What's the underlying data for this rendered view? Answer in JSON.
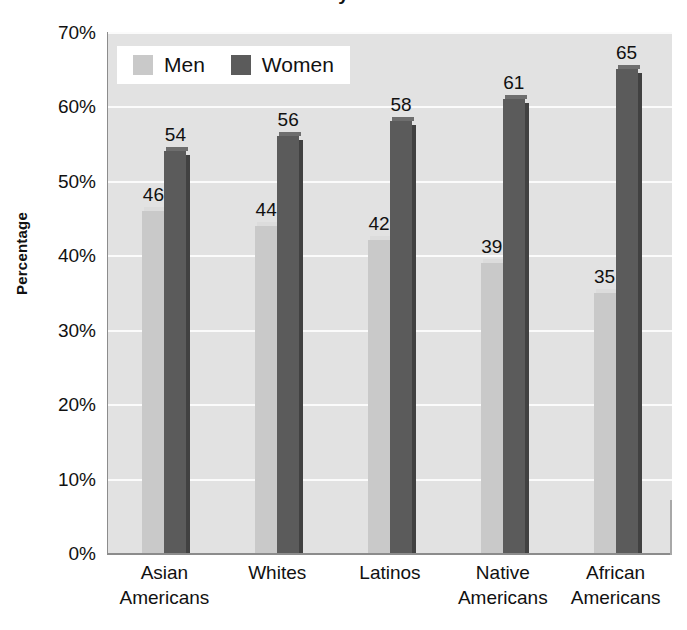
{
  "title_remnant": "y",
  "axis": {
    "y_title": "Percentage",
    "y_ticks": [
      "70%",
      "60%",
      "50%",
      "40%",
      "30%",
      "20%",
      "10%",
      "0%"
    ]
  },
  "legend": {
    "entries": [
      {
        "label": "Men",
        "color": "#c9c9c9",
        "key": "men"
      },
      {
        "label": "Women",
        "color": "#5b5b5b",
        "key": "women"
      }
    ]
  },
  "chart_data": {
    "type": "bar",
    "title": "",
    "xlabel": "",
    "ylabel": "Percentage",
    "ylim": [
      0,
      70
    ],
    "ytick_step": 10,
    "grid": true,
    "legend_position": "top-left-inside",
    "categories": [
      "Asian Americans",
      "Whites",
      "Latinos",
      "Native Americans",
      "African Americans"
    ],
    "category_lines": [
      [
        "Asian",
        "Americans"
      ],
      [
        "Whites"
      ],
      [
        "Latinos"
      ],
      [
        "Native",
        "Americans"
      ],
      [
        "African",
        "Americans"
      ]
    ],
    "series": [
      {
        "name": "Men",
        "color": "#c9c9c9",
        "values": [
          46,
          44,
          42,
          39,
          35
        ]
      },
      {
        "name": "Women",
        "color": "#5b5b5b",
        "values": [
          54,
          56,
          58,
          61,
          65
        ]
      }
    ],
    "value_labels": {
      "Men": [
        "46",
        "44",
        "42",
        "39",
        "35"
      ],
      "Women": [
        "54",
        "56",
        "58",
        "61",
        "65"
      ]
    }
  }
}
